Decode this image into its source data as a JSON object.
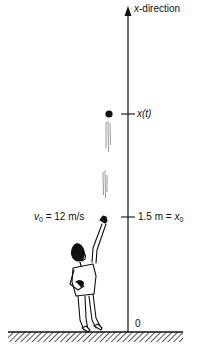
{
  "diagram": {
    "axis": {
      "label_var": "x",
      "label_rest": "-direction",
      "origin_label": "0"
    },
    "ball_marker": {
      "var": "x",
      "arg": "(t)"
    },
    "initial_marker": {
      "value": "1.5 m = ",
      "var": "x",
      "sub": "0"
    },
    "velocity_label": {
      "var": "v",
      "sub": "0",
      "value": " = 12 m/s"
    },
    "colors": {
      "ink": "#111111",
      "background": "#ffffff"
    }
  }
}
